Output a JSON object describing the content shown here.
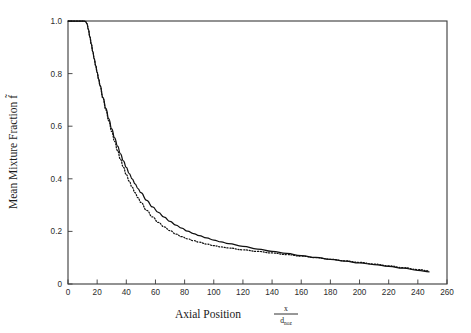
{
  "chart_data": {
    "type": "line",
    "title": "",
    "xlabel": "Axial Position",
    "xlabel_fraction_numerator": "x",
    "xlabel_fraction_denominator": "d",
    "xlabel_fraction_denominator_subscript": "noz",
    "ylabel": "Mean Mixture Fraction f̃",
    "xlim": [
      0,
      260
    ],
    "ylim": [
      0,
      1.0
    ],
    "xticks": [
      0,
      20,
      40,
      60,
      80,
      100,
      120,
      140,
      160,
      180,
      200,
      220,
      240,
      260
    ],
    "xtick_labels": [
      "0",
      "20",
      "40",
      "60",
      "80",
      "100",
      "120",
      "140",
      "160",
      "180",
      "200",
      "220",
      "240",
      "260"
    ],
    "yticks": [
      0,
      0.2,
      0.4,
      0.6,
      0.8,
      1.0
    ],
    "ytick_labels": [
      "0",
      "0.2",
      "0.4",
      "0.6",
      "0.8",
      "1.0"
    ],
    "grid": false,
    "legend": "none",
    "tick_direction": "in",
    "series": [
      {
        "name": "solid-curve",
        "style": "solid",
        "color": "#111111",
        "x": [
          0,
          2,
          4,
          6,
          8,
          10,
          11,
          12,
          13,
          14,
          15,
          16,
          17,
          18,
          19,
          20,
          21,
          22,
          24,
          26,
          28,
          30,
          32,
          34,
          36,
          38,
          40,
          42,
          44,
          46,
          48,
          50,
          54,
          58,
          62,
          66,
          70,
          74,
          78,
          82,
          86,
          90,
          95,
          100,
          105,
          110,
          120,
          130,
          140,
          150,
          160,
          170,
          180,
          190,
          200,
          210,
          220,
          230,
          240,
          248
        ],
        "y": [
          1.0,
          1.0,
          1.0,
          1.0,
          1.0,
          1.0,
          1.0,
          0.998,
          0.99,
          0.968,
          0.94,
          0.912,
          0.884,
          0.856,
          0.83,
          0.805,
          0.78,
          0.755,
          0.71,
          0.668,
          0.628,
          0.59,
          0.556,
          0.524,
          0.495,
          0.468,
          0.443,
          0.42,
          0.4,
          0.381,
          0.363,
          0.347,
          0.318,
          0.293,
          0.272,
          0.254,
          0.238,
          0.224,
          0.212,
          0.201,
          0.192,
          0.184,
          0.175,
          0.167,
          0.16,
          0.154,
          0.143,
          0.133,
          0.124,
          0.116,
          0.108,
          0.101,
          0.094,
          0.087,
          0.08,
          0.074,
          0.067,
          0.06,
          0.052,
          0.046
        ]
      },
      {
        "name": "dotted-curve",
        "style": "dotted",
        "color": "#111111",
        "x": [
          0,
          2,
          4,
          6,
          8,
          10,
          11,
          12,
          13,
          14,
          15,
          16,
          17,
          18,
          19,
          20,
          21,
          22,
          24,
          26,
          28,
          30,
          32,
          34,
          36,
          38,
          40,
          42,
          44,
          46,
          48,
          50,
          54,
          58,
          62,
          66,
          70,
          74,
          78,
          82,
          86,
          90,
          95,
          100,
          105,
          110,
          120,
          130,
          140,
          150,
          160,
          170,
          180,
          190,
          200,
          210,
          220,
          230,
          240,
          248
        ],
        "y": [
          1.0,
          1.0,
          1.0,
          1.0,
          1.0,
          1.0,
          1.0,
          0.998,
          0.99,
          0.968,
          0.94,
          0.912,
          0.884,
          0.856,
          0.83,
          0.805,
          0.78,
          0.753,
          0.706,
          0.662,
          0.62,
          0.58,
          0.542,
          0.507,
          0.474,
          0.444,
          0.416,
          0.391,
          0.368,
          0.347,
          0.328,
          0.31,
          0.28,
          0.255,
          0.234,
          0.217,
          0.203,
          0.19,
          0.18,
          0.172,
          0.165,
          0.159,
          0.152,
          0.146,
          0.141,
          0.137,
          0.13,
          0.124,
          0.118,
          0.112,
          0.106,
          0.1,
          0.094,
          0.088,
          0.082,
          0.076,
          0.069,
          0.062,
          0.055,
          0.05
        ]
      }
    ]
  }
}
